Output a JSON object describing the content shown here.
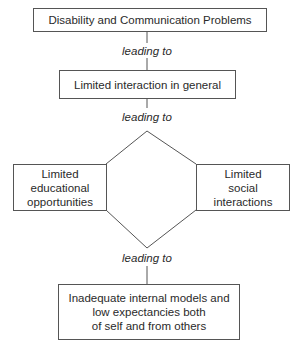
{
  "diagram": {
    "type": "flowchart",
    "nodes": [
      {
        "id": "n1",
        "text": "Disability and Communication Problems"
      },
      {
        "id": "n2",
        "text": "Limited interaction in general"
      },
      {
        "id": "n3",
        "text": "Limited educational opportunities"
      },
      {
        "id": "n4",
        "text": "Limited social interactions"
      },
      {
        "id": "n5",
        "text": "Inadequate internal models and low expectancies both of self and from others"
      }
    ],
    "edge_label": "leading to",
    "edges": [
      {
        "from": "n1",
        "to": "n2",
        "label": "leading to"
      },
      {
        "from": "n2",
        "to": "n3",
        "label": "leading to"
      },
      {
        "from": "n2",
        "to": "n4",
        "label": "leading to"
      },
      {
        "from": "n3",
        "to": "n5",
        "label": "leading to"
      },
      {
        "from": "n4",
        "to": "n5",
        "label": "leading to"
      }
    ]
  },
  "labels": {
    "edge1": "leading to",
    "edge2": "leading to",
    "edge3": "leading to"
  },
  "boxes": {
    "top": "Disability and Communication Problems",
    "second": "Limited interaction in general",
    "left_line1": "Limited",
    "left_line2": "educational",
    "left_line3": "opportunities",
    "right_line1": "Limited",
    "right_line2": "social",
    "right_line3": "interactions",
    "bottom_line1": "Inadequate internal models and",
    "bottom_line2": "low expectancies both",
    "bottom_line3": "of self and from others"
  }
}
